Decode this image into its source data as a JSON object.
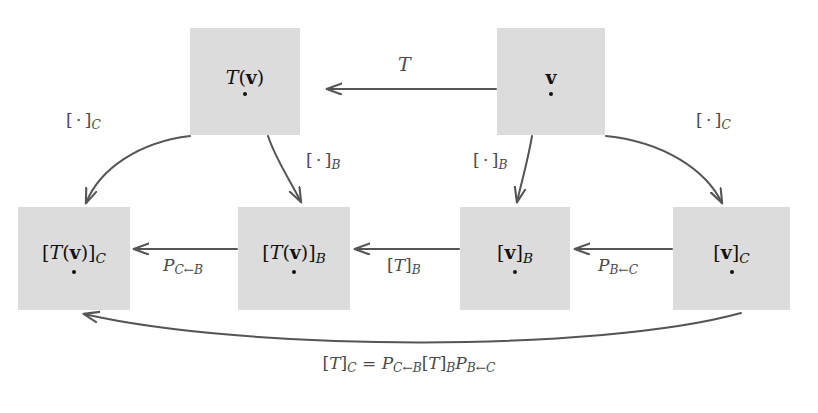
{
  "diagram": {
    "background_color": "#ffffff",
    "node_fill_color": "#dcdcdc",
    "arrow_color": "#555555",
    "label_color": "#4a4a4a",
    "text_color": "#111111",
    "nodes": [
      {
        "id": "Tv",
        "label_html": "<i class='it'>T</i>(<b class='bf'>v</b>)",
        "x": 190,
        "y": 28,
        "w": 110,
        "h": 107
      },
      {
        "id": "v",
        "label_html": "<b class='bf'>v</b>",
        "x": 497,
        "y": 28,
        "w": 108,
        "h": 107
      },
      {
        "id": "TvC",
        "label_html": "[<i class='it'>T</i>(<b class='bf'>v</b>)]<sub class='sb'>C</sub>",
        "x": 18,
        "y": 207,
        "w": 112,
        "h": 103
      },
      {
        "id": "TvB",
        "label_html": "[<i class='it'>T</i>(<b class='bf'>v</b>)]<sub class='sb'>B</sub>",
        "x": 238,
        "y": 207,
        "w": 112,
        "h": 103
      },
      {
        "id": "vB",
        "label_html": "[<b class='bf'>v</b>]<sub class='sb'>B</sub>",
        "x": 460,
        "y": 207,
        "w": 110,
        "h": 103
      },
      {
        "id": "vC",
        "label_html": "[<b class='bf'>v</b>]<sub class='sb'>C</sub>",
        "x": 673,
        "y": 207,
        "w": 117,
        "h": 103
      }
    ],
    "edge_labels": [
      {
        "id": "T",
        "html": "<i class='it'>T</i>",
        "x": 398,
        "y": 55,
        "size": 19
      },
      {
        "id": "dotC_left",
        "html": "[&#8201;&#183;&#8201;]<sub class='sb'>C</sub>",
        "x": 66,
        "y": 112,
        "size": 17
      },
      {
        "id": "dotC_right",
        "html": "[&#8201;&#183;&#8201;]<sub class='sb'>C</sub>",
        "x": 696,
        "y": 112,
        "size": 17
      },
      {
        "id": "dotB_left",
        "html": "[&#8201;&#183;&#8201;]<sub class='sb'>B</sub>",
        "x": 306,
        "y": 152,
        "size": 17
      },
      {
        "id": "dotB_right",
        "html": "[&#8201;&#183;&#8201;]<sub class='sb'>B</sub>",
        "x": 473,
        "y": 152,
        "size": 17
      },
      {
        "id": "PCB",
        "html": "<i class='it'>P</i><sub class='sb'>C&#8592;B</sub>",
        "x": 163,
        "y": 257,
        "size": 17
      },
      {
        "id": "TB",
        "html": "[<i class='it'>T</i>]<sub class='sb'>B</sub>",
        "x": 387,
        "y": 257,
        "size": 17
      },
      {
        "id": "PBC",
        "html": "<i class='it'>P</i><sub class='sb'>B&#8592;C</sub>",
        "x": 598,
        "y": 257,
        "size": 17
      }
    ],
    "equation": {
      "html": "[<i class='it'>T</i>]<sub class='sb'>C</sub> = <i class='it'>P</i><sub class='sb'>C&#8592;B</sub>[<i class='it'>T</i>]<sub class='sb'>B</sub><i class='it'>P</i><sub class='sb'>B&#8592;C</sub>",
      "plain": "[T]_C = P_{C<-B}[T]_B P_{B<-C}",
      "x": 409,
      "y": 355
    }
  }
}
